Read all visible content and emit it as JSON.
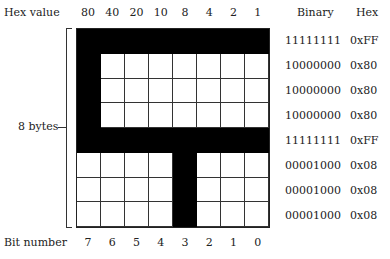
{
  "header": {
    "hex_value_label": "Hex value",
    "binary_label": "Binary",
    "hex_label": "Hex"
  },
  "hex_values": [
    "80",
    "40",
    "20",
    "10",
    "8",
    "4",
    "2",
    "1"
  ],
  "bit_numbers": [
    "7",
    "6",
    "5",
    "4",
    "3",
    "2",
    "1",
    "0"
  ],
  "bit_number_label": "Bit number",
  "bytes_label": "8 bytes",
  "rows": [
    {
      "bits": "11111111",
      "binary": "11111111",
      "hex": "0xFF"
    },
    {
      "bits": "10000000",
      "binary": "10000000",
      "hex": "0x80"
    },
    {
      "bits": "10000000",
      "binary": "10000000",
      "hex": "0x80"
    },
    {
      "bits": "10000000",
      "binary": "10000000",
      "hex": "0x80"
    },
    {
      "bits": "11111111",
      "binary": "11111111",
      "hex": "0xFF"
    },
    {
      "bits": "00001000",
      "binary": "00001000",
      "hex": "0x08"
    },
    {
      "bits": "00001000",
      "binary": "00001000",
      "hex": "0x08"
    },
    {
      "bits": "00001000",
      "binary": "00001000",
      "hex": "0x08"
    }
  ],
  "colors": {
    "on": "#000000",
    "off": "#ffffff",
    "grid": "#333333"
  }
}
